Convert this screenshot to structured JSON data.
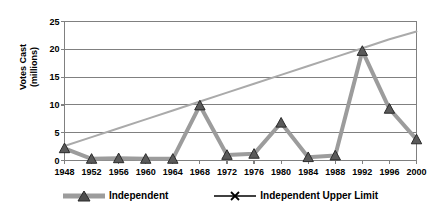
{
  "chart_data": {
    "type": "line",
    "title": "",
    "subtitle": "",
    "xlabel": "",
    "ylabel": "Votes Cast\n(millions)",
    "x": [
      1948,
      1952,
      1956,
      1960,
      1964,
      1968,
      1972,
      1976,
      1980,
      1984,
      1988,
      1992,
      1996,
      2000
    ],
    "xtick_labels": [
      "1948",
      "1952",
      "1956",
      "1960",
      "1964",
      "1968",
      "1972",
      "1976",
      "1980",
      "1984",
      "1988",
      "1992",
      "1996",
      "2000"
    ],
    "ytick_labels": [
      "0",
      "5",
      "10",
      "15",
      "20",
      "25"
    ],
    "yticks": [
      0,
      5,
      10,
      15,
      20,
      25
    ],
    "ylim": [
      0,
      25
    ],
    "xlim": [
      1948,
      2000
    ],
    "grid": "horizontal",
    "legend_position": "bottom",
    "series": [
      {
        "name": "Independent",
        "color": "#9c9c9c",
        "marker": "triangle",
        "marker_color": "#5a5a5a",
        "line_width": 4,
        "values": [
          2.2,
          0.3,
          0.4,
          0.3,
          0.3,
          9.9,
          1.0,
          1.2,
          6.8,
          0.6,
          0.9,
          19.7,
          9.3,
          3.8
        ]
      },
      {
        "name": "Independent Upper Limit",
        "color": "#aaaaaa",
        "marker": "x",
        "marker_color": "#000000",
        "line_width": 2,
        "values": [
          2.6,
          4.2,
          5.8,
          7.4,
          9.0,
          10.6,
          12.2,
          13.8,
          15.4,
          17.0,
          18.6,
          20.2,
          21.8,
          23.2
        ]
      }
    ]
  },
  "legend": {
    "items": [
      {
        "label": "Independent",
        "marker": "triangle-marker",
        "swatch_color": "#9c9c9c"
      },
      {
        "label": "Independent Upper Limit",
        "marker": "x-marker",
        "swatch_color": "#000000"
      }
    ]
  },
  "axes": {
    "y_title": "Votes Cast\n(millions)",
    "axis_color": "#808080",
    "grid_color": "#808080",
    "background": "#ffffff"
  }
}
